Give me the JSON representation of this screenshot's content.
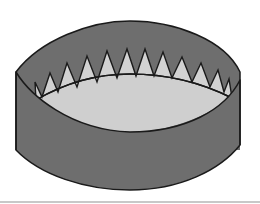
{
  "figure": {
    "title": "",
    "colors": {
      "background": "#ffffff",
      "band": "#6e6e6e",
      "inner": "#cfcfcf",
      "teeth": "#d2d2d2",
      "outline": "#1a1a1a",
      "baseline": "#c8c8c8"
    },
    "tooth_count": 12
  }
}
